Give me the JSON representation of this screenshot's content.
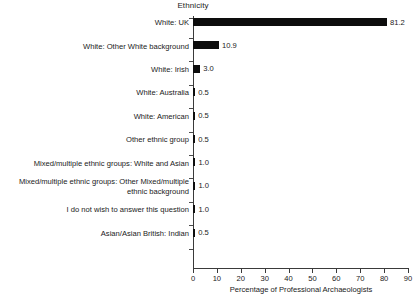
{
  "chart_data": {
    "type": "bar",
    "orientation": "horizontal",
    "title": "Ethnicity",
    "xlabel": "Percentage of Professional Archaeologists",
    "ylabel": "",
    "xlim": [
      0,
      90
    ],
    "xticks": [
      0,
      10,
      20,
      30,
      40,
      50,
      60,
      70,
      80,
      90
    ],
    "grid": false,
    "legend": false,
    "bar_color": "#0d0d0d",
    "categories": [
      "White: UK",
      "White: Other White background",
      "White: Irish",
      "White: Australia",
      "White: American",
      "Other ethnic group",
      "Mixed/multiple ethnic groups: White and Asian",
      "Mixed/multiple ethnic groups: Other Mixed/multiple\nethnic background",
      "I do not wish to answer this question",
      "Asian/Asian British: Indian"
    ],
    "values": [
      81.2,
      10.9,
      3.0,
      0.5,
      0.5,
      0.5,
      1.0,
      1.0,
      1.0,
      0.5
    ],
    "value_labels": [
      "81.2",
      "10.9",
      "3.0",
      "0.5",
      "0.5",
      "0.5",
      "1.0",
      "1.0",
      "1.0",
      "0.5"
    ]
  }
}
